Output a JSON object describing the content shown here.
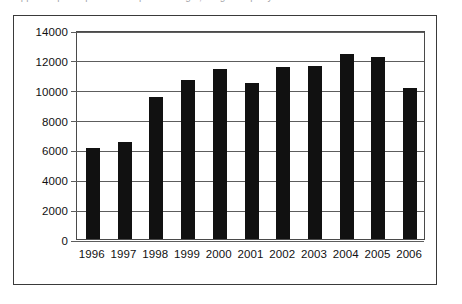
{
  "caption": {
    "text": "Apparent per capita consumption of sugar, kilograms per year"
  },
  "chart_data": {
    "type": "bar",
    "title": "",
    "xlabel": "",
    "ylabel": "",
    "categories": [
      "1996",
      "1997",
      "1998",
      "1999",
      "2000",
      "2001",
      "2002",
      "2003",
      "2004",
      "2005",
      "2006"
    ],
    "values": [
      6100,
      6500,
      9500,
      10650,
      11400,
      10450,
      11500,
      11600,
      12400,
      12200,
      10100
    ],
    "ylim": [
      0,
      14000
    ],
    "ytick_values": [
      0,
      2000,
      4000,
      6000,
      8000,
      10000,
      12000,
      14000
    ],
    "ytick_labels": [
      "0",
      "2000",
      "4000",
      "6000",
      "8000",
      "10000",
      "12000",
      "14000"
    ],
    "grid": "horizontal",
    "legend": "none",
    "bar_color": "#111111",
    "gridline_color": "#5d5d5d",
    "axis_color": "#4a4a4a",
    "frame_color": "#3a3a3a",
    "background_color": "#ffffff"
  }
}
